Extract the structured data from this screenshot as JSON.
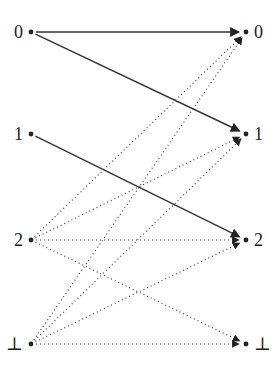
{
  "diagram": {
    "left_nodes": [
      {
        "id": "L0",
        "label": "0",
        "x": 31,
        "y": 32
      },
      {
        "id": "L1",
        "label": "1",
        "x": 31,
        "y": 134
      },
      {
        "id": "L2",
        "label": "2",
        "x": 31,
        "y": 240
      },
      {
        "id": "Lbot",
        "label": "⊥",
        "x": 31,
        "y": 344
      }
    ],
    "right_nodes": [
      {
        "id": "R0",
        "label": "0",
        "x": 246,
        "y": 32
      },
      {
        "id": "R1",
        "label": "1",
        "x": 246,
        "y": 134
      },
      {
        "id": "R2",
        "label": "2",
        "x": 246,
        "y": 240
      },
      {
        "id": "Rbot",
        "label": "⊥",
        "x": 246,
        "y": 344
      }
    ],
    "edges": [
      {
        "from": "L0",
        "to": "R0",
        "style": "solid"
      },
      {
        "from": "L0",
        "to": "R1",
        "style": "solid"
      },
      {
        "from": "L1",
        "to": "R2",
        "style": "solid"
      },
      {
        "from": "L2",
        "to": "R0",
        "style": "dotted"
      },
      {
        "from": "L2",
        "to": "R1",
        "style": "dotted"
      },
      {
        "from": "L2",
        "to": "R2",
        "style": "dotted"
      },
      {
        "from": "L2",
        "to": "Rbot",
        "style": "dotted"
      },
      {
        "from": "Lbot",
        "to": "R0",
        "style": "dotted"
      },
      {
        "from": "Lbot",
        "to": "R1",
        "style": "dotted"
      },
      {
        "from": "Lbot",
        "to": "R2",
        "style": "dotted"
      },
      {
        "from": "Lbot",
        "to": "Rbot",
        "style": "dotted"
      }
    ],
    "colors": {
      "stroke": "#333333",
      "dot": "#222222"
    }
  }
}
